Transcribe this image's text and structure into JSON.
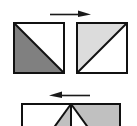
{
  "figure": {
    "canvas": {
      "width": 137,
      "height": 126,
      "background": "#ffffff"
    },
    "palette": {
      "outline": "#111111",
      "white_fill": "#ffffff",
      "dark_gray_fill": "#808080",
      "light_gray_fill": "#dcdcdc",
      "mid_gray_fill": "#c0c0c0",
      "arrow_color": "#1a1a1a"
    },
    "rows": [
      {
        "name": "top-row",
        "arrow": {
          "name": "arrow-right",
          "direction": "right",
          "glyph": "→",
          "x1": 50,
          "y1": 14,
          "x2": 90,
          "y2": 14
        },
        "shapes": [
          {
            "name": "square-source",
            "label": "source square",
            "x": 14,
            "y": 23,
            "width": 50,
            "height": 50,
            "diagonal": "top-left-to-bottom-right",
            "triangles": [
              {
                "name": "lower-left-triangle",
                "fill": "#808080",
                "points": "0,0 0,50 50,50"
              },
              {
                "name": "upper-right-triangle",
                "fill": "#ffffff",
                "points": "0,0 50,0 50,50"
              }
            ]
          },
          {
            "name": "square-target",
            "label": "target square",
            "x": 77,
            "y": 23,
            "width": 50,
            "height": 50,
            "diagonal": "bottom-left-to-top-right",
            "triangles": [
              {
                "name": "upper-left-triangle",
                "fill": "#dcdcdc",
                "points": "0,0 50,0 0,50"
              },
              {
                "name": "lower-right-triangle",
                "fill": "#ffffff",
                "points": "50,0 50,50 0,50"
              }
            ]
          }
        ]
      },
      {
        "name": "bottom-row",
        "arrow": {
          "name": "arrow-left",
          "direction": "left",
          "glyph": "←",
          "x1": 90,
          "y1": 95,
          "x2": 50,
          "y2": 95
        },
        "shapes": [
          {
            "name": "fan-rectangle",
            "label": "rectangle with radiating wedges",
            "x": 22,
            "y": 104,
            "width": 98,
            "height": 40,
            "clipped_bottom": true,
            "apex": {
              "x": 49,
              "y": 0
            },
            "wedges": [
              {
                "name": "wedge-1-white",
                "fill": "#ffffff",
                "points": "0,0 49,0 20,40 0,40"
              },
              {
                "name": "wedge-2-gray",
                "fill": "#c0c0c0",
                "points": "49,0 49,40 20,40"
              },
              {
                "name": "wedge-3-white",
                "fill": "#ffffff",
                "points": "49,0 78,40 49,40"
              },
              {
                "name": "wedge-4-gray",
                "fill": "#c0c0c0",
                "points": "49,0 98,0 98,40 78,40"
              }
            ]
          }
        ]
      }
    ]
  }
}
